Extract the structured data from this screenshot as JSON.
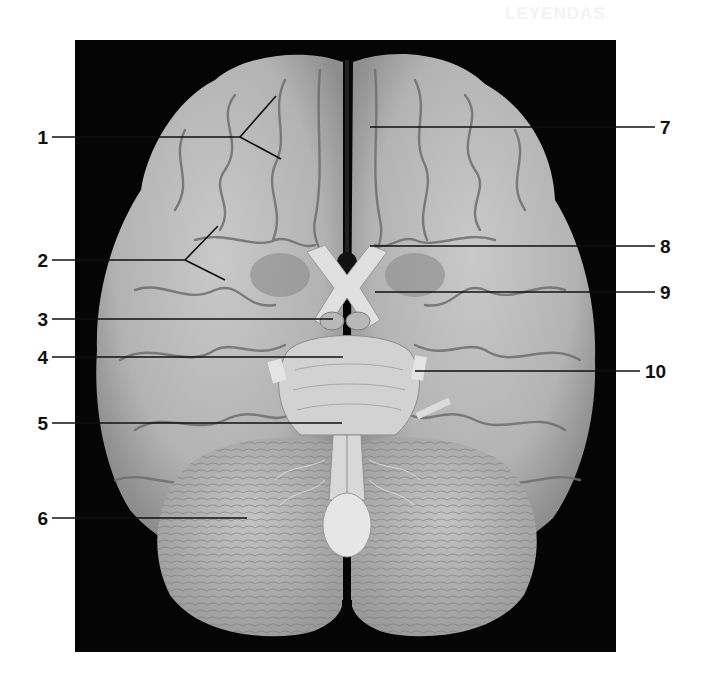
{
  "figure": {
    "type": "anatomical-photograph",
    "background_color": "#050505",
    "page_color": "#ffffff",
    "ghost_text": "LEYENDAS"
  },
  "labels": [
    {
      "number": "1",
      "side": "left",
      "y": 137,
      "line_start_x": 52,
      "line_end_x": 240,
      "branches": [
        [
          276,
          96
        ],
        [
          281,
          159
        ]
      ]
    },
    {
      "number": "2",
      "side": "left",
      "y": 260,
      "line_start_x": 52,
      "line_end_x": 185,
      "branches": [
        [
          218,
          226
        ],
        [
          225,
          280
        ]
      ]
    },
    {
      "number": "3",
      "side": "left",
      "y": 319,
      "line_start_x": 52,
      "line_end_x": 333
    },
    {
      "number": "4",
      "side": "left",
      "y": 357,
      "line_start_x": 52,
      "line_end_x": 343
    },
    {
      "number": "5",
      "side": "left",
      "y": 423,
      "line_start_x": 52,
      "line_end_x": 342
    },
    {
      "number": "6",
      "side": "left",
      "y": 518,
      "line_start_x": 52,
      "line_end_x": 247
    },
    {
      "number": "7",
      "side": "right",
      "y": 127,
      "line_start_x": 370,
      "line_end_x": 655
    },
    {
      "number": "8",
      "side": "right",
      "y": 246,
      "line_start_x": 370,
      "line_end_x": 655
    },
    {
      "number": "9",
      "side": "right",
      "y": 292,
      "line_start_x": 375,
      "line_end_x": 655
    },
    {
      "number": "10",
      "side": "right",
      "y": 371,
      "line_start_x": 415,
      "line_end_x": 640
    }
  ]
}
